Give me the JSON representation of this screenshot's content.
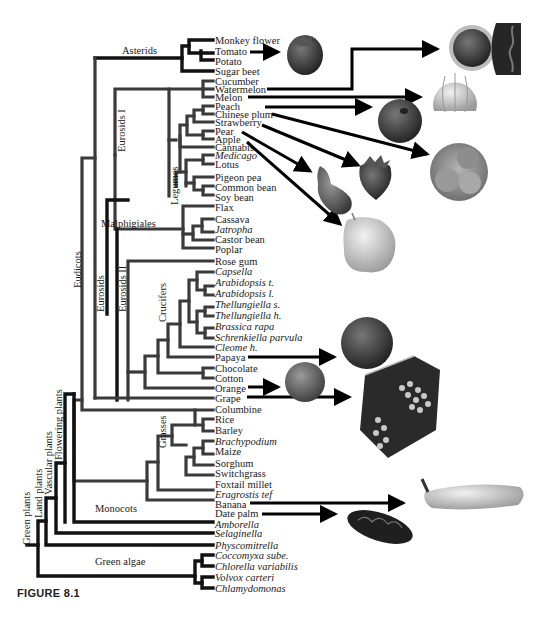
{
  "figure": {
    "caption": "FIGURE 8.1",
    "type": "phylogenetic tree"
  },
  "clades": {
    "asterids": "Asterids",
    "eurosids_i": "Eurosids I",
    "legumes": "Legumes",
    "malphigiales": "Malphigiales",
    "eurosids": "Eurosids",
    "eurosids_ii": "Eurosids II",
    "crucifers": "Crucifers",
    "eudicots": "Eudicots",
    "grasses": "Grasses",
    "monocots": "Monocots",
    "flowering_plants": "Flowering plants",
    "vascular_plants": "Vascular plants",
    "land_plants": "Land plants",
    "green_plants": "Green plants",
    "green_algae": "Green algae"
  },
  "leaves": [
    {
      "name": "Monkey flower",
      "italic": false
    },
    {
      "name": "Tomato",
      "italic": false
    },
    {
      "name": "Potato",
      "italic": false
    },
    {
      "name": "Sugar beet",
      "italic": false
    },
    {
      "name": "Cucumber",
      "italic": false
    },
    {
      "name": "Watermelon",
      "italic": false
    },
    {
      "name": "Melon",
      "italic": false
    },
    {
      "name": "Peach",
      "italic": false
    },
    {
      "name": "Chinese plum",
      "italic": false
    },
    {
      "name": "Strawberry",
      "italic": false
    },
    {
      "name": "Pear",
      "italic": false
    },
    {
      "name": "Apple",
      "italic": false
    },
    {
      "name": "Cannabis",
      "italic": false
    },
    {
      "name": "Medicago",
      "italic": true
    },
    {
      "name": "Lotus",
      "italic": false
    },
    {
      "name": "Pigeon pea",
      "italic": false
    },
    {
      "name": "Common bean",
      "italic": false
    },
    {
      "name": "Soy bean",
      "italic": false
    },
    {
      "name": "Flax",
      "italic": false
    },
    {
      "name": "Cassava",
      "italic": false
    },
    {
      "name": "Jatropha",
      "italic": true
    },
    {
      "name": "Castor bean",
      "italic": false
    },
    {
      "name": "Poplar",
      "italic": false
    },
    {
      "name": "Rose gum",
      "italic": false
    },
    {
      "name": "Capsella",
      "italic": true
    },
    {
      "name": "Arabidopsis t.",
      "italic": true
    },
    {
      "name": "Arabidopsis l.",
      "italic": true
    },
    {
      "name": "Thellungiella s.",
      "italic": true
    },
    {
      "name": "Thellungiella h.",
      "italic": true
    },
    {
      "name": "Brassica rapa",
      "italic": true
    },
    {
      "name": "Schrenkiella parvula",
      "italic": true
    },
    {
      "name": "Cleome h.",
      "italic": true
    },
    {
      "name": "Papaya",
      "italic": false
    },
    {
      "name": "Chocolate",
      "italic": false
    },
    {
      "name": "Cotton",
      "italic": false
    },
    {
      "name": "Orange",
      "italic": false
    },
    {
      "name": "Grape",
      "italic": false
    },
    {
      "name": "Columbine",
      "italic": false
    },
    {
      "name": "Rice",
      "italic": false
    },
    {
      "name": "Barley",
      "italic": false
    },
    {
      "name": "Brachypodium",
      "italic": true
    },
    {
      "name": "Maize",
      "italic": false
    },
    {
      "name": "Sorghum",
      "italic": false
    },
    {
      "name": "Switchgrass",
      "italic": false
    },
    {
      "name": "Foxtail millet",
      "italic": false
    },
    {
      "name": "Eragrostis tef",
      "italic": true
    },
    {
      "name": "Banana",
      "italic": false
    },
    {
      "name": "Date palm",
      "italic": false
    },
    {
      "name": "Amborella",
      "italic": true
    },
    {
      "name": "Selaginella",
      "italic": true
    },
    {
      "name": "Physcomitrella",
      "italic": true
    },
    {
      "name": "Coccomyxa sube.",
      "italic": true
    },
    {
      "name": "Chlorella variabilis",
      "italic": true
    },
    {
      "name": "Volvox carteri",
      "italic": true
    },
    {
      "name": "Chlamydomonas",
      "italic": true
    }
  ],
  "fruit_images": [
    {
      "label": "tomato-photo",
      "linked_leaf": "Tomato"
    },
    {
      "label": "watermelon-photo",
      "linked_leaf": "Watermelon"
    },
    {
      "label": "melon-photo",
      "linked_leaf": "Melon"
    },
    {
      "label": "peach-photo",
      "linked_leaf": "Peach"
    },
    {
      "label": "chinese-plum-photo",
      "linked_leaf": "Chinese plum"
    },
    {
      "label": "strawberry-photo",
      "linked_leaf": "Strawberry"
    },
    {
      "label": "pear-photo",
      "linked_leaf": "Pear"
    },
    {
      "label": "apple-photo",
      "linked_leaf": "Apple"
    },
    {
      "label": "papaya-photo",
      "linked_leaf": "Papaya"
    },
    {
      "label": "orange-photo",
      "linked_leaf": "Orange"
    },
    {
      "label": "grape-photo",
      "linked_leaf": "Grape"
    },
    {
      "label": "banana-photo",
      "linked_leaf": "Banana"
    },
    {
      "label": "date-photo",
      "linked_leaf": "Date palm"
    }
  ]
}
